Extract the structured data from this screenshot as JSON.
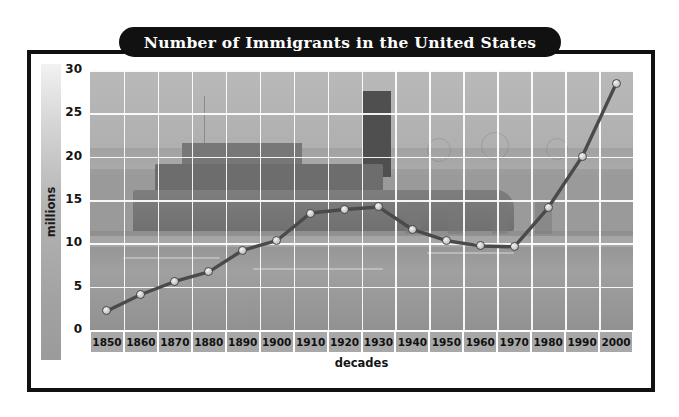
{
  "chart_data": {
    "type": "line",
    "title": "Number of Immigrants in the United States",
    "xlabel": "decades",
    "ylabel": "millions",
    "categories": [
      "1850",
      "1860",
      "1870",
      "1880",
      "1890",
      "1900",
      "1910",
      "1920",
      "1930",
      "1940",
      "1950",
      "1960",
      "1970",
      "1980",
      "1990",
      "2000"
    ],
    "values": [
      2.2,
      4.1,
      5.6,
      6.7,
      9.2,
      10.3,
      13.5,
      13.9,
      14.2,
      11.6,
      10.3,
      9.7,
      9.6,
      14.1,
      20.0,
      28.4
    ],
    "ylim": [
      0,
      30
    ],
    "yticks": [
      0,
      5,
      10,
      15,
      20,
      25,
      30
    ],
    "grid": true,
    "legend": "none",
    "line_color": "#4a4a4a",
    "marker_color": "#e0e0e0",
    "title_background": "#111111",
    "title_color": "#ffffff"
  },
  "chart": {
    "title": "Number of Immigrants in the United States",
    "y_axis_title": "millions",
    "x_axis_title": "decades"
  }
}
